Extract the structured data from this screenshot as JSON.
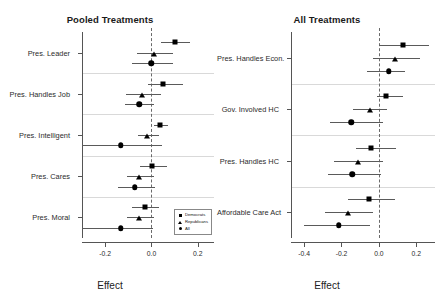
{
  "figure": {
    "panels": [
      {
        "id": "pooled",
        "title": "Pooled Treatments",
        "xlabel": "Effect",
        "xticks": [
          "-0.2",
          "0.0",
          "0.2"
        ],
        "xtick_values": [
          -0.2,
          0.0,
          0.2
        ],
        "xlim": [
          -0.3,
          0.27
        ],
        "zero_reference": 0.0,
        "groups": [
          {
            "label": "Pres. Leader"
          },
          {
            "label": "Pres. Handles Job"
          },
          {
            "label": "Pres. Intelligent"
          },
          {
            "label": "Pres. Cares"
          },
          {
            "label": "Pres. Moral"
          }
        ]
      },
      {
        "id": "all",
        "title": "All Treatments",
        "xlabel": "Effect",
        "xticks": [
          "-0.4",
          "-0.2",
          "0.0",
          "0.2"
        ],
        "xtick_values": [
          -0.4,
          -0.2,
          0.0,
          0.2
        ],
        "xlim": [
          -0.47,
          0.3
        ],
        "zero_reference": 0.0,
        "groups": [
          {
            "label": "Pres. Handles Econ."
          },
          {
            "label": "Gov. Involved HC"
          },
          {
            "label": "Pres. Handles HC"
          },
          {
            "label": "Affordable Care Act"
          }
        ]
      }
    ]
  },
  "legend": {
    "position": "bottom-right-of-left-panel",
    "entries": [
      {
        "label": "Democrats",
        "marker": "square"
      },
      {
        "label": "Republicans",
        "marker": "triangle"
      },
      {
        "label": "All",
        "marker": "circle"
      }
    ]
  },
  "chart_data": [
    {
      "type": "scatter",
      "title": "Pooled Treatments",
      "xlabel": "Effect",
      "ylabel": "",
      "xlim": [
        -0.3,
        0.27
      ],
      "xticks": [
        -0.2,
        0.0,
        0.2
      ],
      "grid": false,
      "legend_position": "bottom-right",
      "orientation": "horizontal-coefficient-plot",
      "zero_reference_line": 0.0,
      "categories": [
        "Pres. Leader",
        "Pres. Handles Job",
        "Pres. Intelligent",
        "Pres. Cares",
        "Pres. Moral"
      ],
      "series": [
        {
          "name": "Democrats",
          "marker": "square",
          "estimates": [
            0.1,
            0.049,
            0.038,
            0.002,
            -0.028
          ],
          "ci_low": [
            0.043,
            -0.013,
            0.01,
            -0.048,
            -0.082
          ],
          "ci_high": [
            0.168,
            0.136,
            0.072,
            0.066,
            0.032
          ]
        },
        {
          "name": "Republicans",
          "marker": "triangle",
          "estimates": [
            0.01,
            -0.042,
            -0.019,
            -0.052,
            -0.052
          ],
          "ci_low": [
            -0.063,
            -0.11,
            -0.06,
            -0.105,
            -0.104
          ],
          "ci_high": [
            0.092,
            0.04,
            0.034,
            0.012,
            0.012
          ]
        },
        {
          "name": "All",
          "marker": "circle",
          "estimates": [
            0.0,
            -0.053,
            -0.133,
            -0.072,
            -0.132
          ],
          "ci_low": [
            -0.086,
            -0.115,
            -0.3,
            -0.145,
            -0.3
          ],
          "ci_high": [
            0.092,
            0.012,
            0.046,
            0.014,
            0.006
          ]
        }
      ]
    },
    {
      "type": "scatter",
      "title": "All Treatments",
      "xlabel": "Effect",
      "ylabel": "",
      "xlim": [
        -0.47,
        0.3
      ],
      "xticks": [
        -0.4,
        -0.2,
        0.0,
        0.2
      ],
      "grid": false,
      "legend_position": "none",
      "orientation": "horizontal-coefficient-plot",
      "zero_reference_line": 0.0,
      "categories": [
        "Pres. Handles Econ.",
        "Gov. Involved HC",
        "Pres. Handles HC",
        "Affordable Care Act"
      ],
      "series": [
        {
          "name": "Democrats",
          "marker": "square",
          "estimates": [
            0.128,
            0.036,
            -0.04,
            -0.052
          ],
          "ci_low": [
            0.0,
            -0.011,
            -0.12,
            -0.165
          ],
          "ci_high": [
            0.266,
            0.128,
            0.09,
            0.085
          ]
        },
        {
          "name": "Republicans",
          "marker": "triangle",
          "estimates": [
            0.086,
            -0.045,
            -0.11,
            -0.165
          ],
          "ci_low": [
            -0.032,
            -0.136,
            -0.24,
            -0.29
          ],
          "ci_high": [
            0.22,
            0.046,
            0.02,
            -0.03
          ]
        },
        {
          "name": "All",
          "marker": "circle",
          "estimates": [
            0.054,
            -0.148,
            -0.143,
            -0.215
          ],
          "ci_low": [
            -0.064,
            -0.26,
            -0.27,
            -0.4
          ],
          "ci_high": [
            0.14,
            0.022,
            0.01,
            -0.05
          ]
        }
      ]
    }
  ]
}
